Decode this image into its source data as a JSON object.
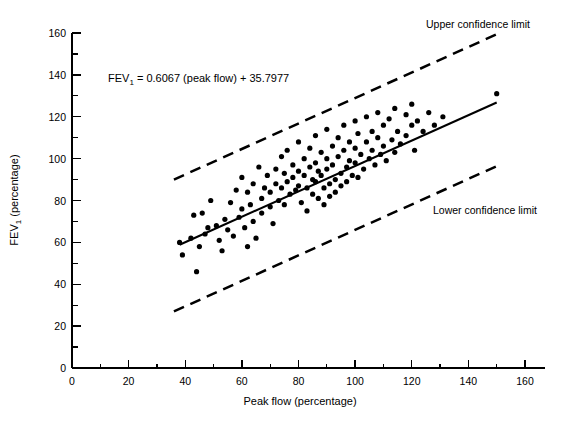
{
  "chart_data": {
    "type": "scatter",
    "title": "",
    "xlabel": "Peak flow (percentage)",
    "ylabel": "FEV1 (percentage)",
    "ylabel_base": "FEV",
    "ylabel_sub": "1",
    "ylabel_rest": " (percentage)",
    "xlim": [
      0,
      160
    ],
    "ylim": [
      0,
      160
    ],
    "grid": false,
    "legend_position": "none",
    "x_ticks_major": [
      0,
      20,
      40,
      60,
      80,
      100,
      120,
      140,
      160
    ],
    "x_ticks_minor": [
      10,
      30,
      50,
      70,
      90,
      110,
      130,
      150
    ],
    "y_ticks_major": [
      0,
      20,
      40,
      60,
      80,
      100,
      120,
      140,
      160
    ],
    "y_ticks_minor": [
      10,
      30,
      50,
      70,
      90,
      110,
      130,
      150
    ],
    "equation": "FEV1 = 0.6067 (peak flow) + 35.7977",
    "equation_parts": {
      "base": "FEV",
      "sub": "1",
      "rest": " = 0.6067 (peak flow) + 35.7977"
    },
    "regression": {
      "label": "regression line",
      "slope": 0.6067,
      "intercept": 35.7977,
      "x_start": 38,
      "x_end": 150,
      "y_start": 58.9,
      "y_end": 126.8,
      "style": "solid"
    },
    "annotations": [
      {
        "name": "upper-confidence-limit",
        "text": "Upper confidence limit"
      },
      {
        "name": "lower-confidence-limit",
        "text": "Lower confidence limit"
      }
    ],
    "confidence_bands": [
      {
        "name": "upper",
        "label": "Upper confidence limit",
        "style": "dashed",
        "x_start": 36,
        "y_start": 90,
        "x_end": 151,
        "y_end": 160
      },
      {
        "name": "lower",
        "label": "Lower confidence limit",
        "style": "dashed",
        "x_start": 36,
        "y_start": 27,
        "x_end": 151,
        "y_end": 97
      }
    ],
    "point_count": 126,
    "point_radius": 2.6,
    "points": [
      [
        38,
        60
      ],
      [
        39,
        54
      ],
      [
        42,
        62
      ],
      [
        43,
        73
      ],
      [
        44,
        46
      ],
      [
        45,
        58
      ],
      [
        46,
        74
      ],
      [
        47,
        64
      ],
      [
        48,
        67
      ],
      [
        49,
        80
      ],
      [
        51,
        68
      ],
      [
        52,
        61
      ],
      [
        53,
        56
      ],
      [
        54,
        71
      ],
      [
        55,
        66
      ],
      [
        56,
        79
      ],
      [
        57,
        63
      ],
      [
        58,
        85
      ],
      [
        59,
        72
      ],
      [
        60,
        91
      ],
      [
        60,
        76
      ],
      [
        61,
        67
      ],
      [
        62,
        84
      ],
      [
        62,
        58
      ],
      [
        63,
        78
      ],
      [
        64,
        88
      ],
      [
        64,
        70
      ],
      [
        65,
        62
      ],
      [
        66,
        96
      ],
      [
        67,
        81
      ],
      [
        67,
        74
      ],
      [
        68,
        86
      ],
      [
        69,
        92
      ],
      [
        70,
        77
      ],
      [
        70,
        84
      ],
      [
        71,
        69
      ],
      [
        72,
        95
      ],
      [
        72,
        88
      ],
      [
        73,
        80
      ],
      [
        74,
        101
      ],
      [
        74,
        86
      ],
      [
        75,
        93
      ],
      [
        75,
        78
      ],
      [
        76,
        104
      ],
      [
        76,
        89
      ],
      [
        77,
        83
      ],
      [
        78,
        97
      ],
      [
        78,
        91
      ],
      [
        79,
        85
      ],
      [
        80,
        108
      ],
      [
        80,
        94
      ],
      [
        80,
        87
      ],
      [
        81,
        79
      ],
      [
        82,
        100
      ],
      [
        82,
        92
      ],
      [
        83,
        86
      ],
      [
        83,
        75
      ],
      [
        84,
        105
      ],
      [
        84,
        96
      ],
      [
        85,
        90
      ],
      [
        85,
        83
      ],
      [
        86,
        111
      ],
      [
        86,
        98
      ],
      [
        86,
        89
      ],
      [
        87,
        94
      ],
      [
        87,
        81
      ],
      [
        88,
        103
      ],
      [
        88,
        92
      ],
      [
        89,
        86
      ],
      [
        89,
        78
      ],
      [
        90,
        114
      ],
      [
        90,
        100
      ],
      [
        90,
        95
      ],
      [
        91,
        88
      ],
      [
        91,
        82
      ],
      [
        92,
        106
      ],
      [
        92,
        97
      ],
      [
        93,
        90
      ],
      [
        93,
        84
      ],
      [
        94,
        110
      ],
      [
        94,
        101
      ],
      [
        95,
        93
      ],
      [
        95,
        87
      ],
      [
        96,
        116
      ],
      [
        96,
        104
      ],
      [
        97,
        96
      ],
      [
        97,
        89
      ],
      [
        98,
        108
      ],
      [
        98,
        99
      ],
      [
        99,
        92
      ],
      [
        100,
        118
      ],
      [
        100,
        105
      ],
      [
        100,
        98
      ],
      [
        101,
        112
      ],
      [
        101,
        91
      ],
      [
        102,
        102
      ],
      [
        103,
        95
      ],
      [
        104,
        120
      ],
      [
        104,
        108
      ],
      [
        105,
        100
      ],
      [
        106,
        113
      ],
      [
        106,
        104
      ],
      [
        107,
        97
      ],
      [
        108,
        122
      ],
      [
        108,
        110
      ],
      [
        109,
        102
      ],
      [
        110,
        116
      ],
      [
        110,
        106
      ],
      [
        111,
        99
      ],
      [
        112,
        119
      ],
      [
        113,
        109
      ],
      [
        114,
        124
      ],
      [
        114,
        103
      ],
      [
        115,
        113
      ],
      [
        116,
        107
      ],
      [
        118,
        121
      ],
      [
        118,
        111
      ],
      [
        120,
        126
      ],
      [
        120,
        116
      ],
      [
        121,
        104
      ],
      [
        122,
        118
      ],
      [
        124,
        113
      ],
      [
        126,
        122
      ],
      [
        128,
        116
      ],
      [
        131,
        120
      ],
      [
        150,
        131
      ]
    ]
  },
  "axis_titles": {
    "x": "Peak flow  (percentage)",
    "y_base": "FEV",
    "y_sub": "1",
    "y_rest": "  (percentage)"
  }
}
